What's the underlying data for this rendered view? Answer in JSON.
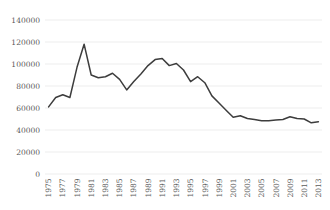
{
  "chart_data": {
    "type": "line",
    "title": "",
    "xlabel": "",
    "ylabel": "",
    "x": [
      1975,
      1976,
      1977,
      1978,
      1979,
      1980,
      1981,
      1982,
      1983,
      1984,
      1985,
      1986,
      1987,
      1988,
      1989,
      1990,
      1991,
      1992,
      1993,
      1994,
      1995,
      1996,
      1997,
      1998,
      1999,
      2000,
      2001,
      2002,
      2003,
      2004,
      2005,
      2006,
      2007,
      2008,
      2009,
      2010,
      2011,
      2012,
      2013
    ],
    "values": [
      61000,
      69500,
      72000,
      69500,
      97000,
      118000,
      90000,
      87500,
      88500,
      91500,
      86000,
      76500,
      84000,
      91000,
      98500,
      104000,
      105000,
      98500,
      100500,
      94500,
      84000,
      88500,
      83000,
      71000,
      64500,
      58000,
      51500,
      53000,
      50500,
      49500,
      48500,
      48500,
      49000,
      49500,
      52000,
      50500,
      50000,
      46500,
      47500
    ],
    "ylim": [
      0,
      140000
    ],
    "ytick_step": 20000,
    "ytick_labels": [
      "0",
      "20000",
      "40000",
      "60000",
      "80000",
      "100000",
      "120000",
      "140000"
    ],
    "xtick_labels": [
      "1975",
      "1977",
      "1979",
      "1981",
      "1983",
      "1985",
      "1987",
      "1989",
      "1991",
      "1993",
      "1995",
      "1997",
      "1999",
      "2001",
      "2003",
      "2005",
      "2007",
      "2009",
      "2011",
      "2013"
    ],
    "xtick_label_every": 2,
    "grid": "horizontal",
    "legend": "none",
    "markers": "none",
    "line_color": "#3d3d3d",
    "gridline_color": "#e8e8e8",
    "label_color": "#595959",
    "background_color": "#ffffff"
  }
}
